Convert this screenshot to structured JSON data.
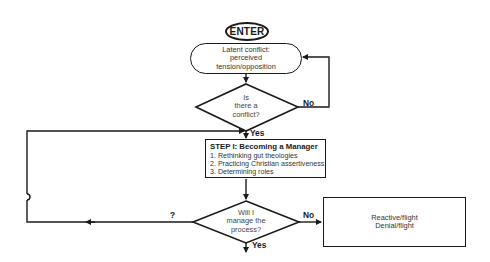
{
  "diagram": {
    "type": "flowchart",
    "start": {
      "label": "ENTER"
    },
    "latent_conflict": {
      "lines": [
        "Latent conflict:",
        "perceived",
        "tension/opposition"
      ]
    },
    "decision_conflict": {
      "lines": [
        "Is",
        "there a",
        "conflict?"
      ],
      "yes_label": "Yes",
      "no_label": "No"
    },
    "step1": {
      "title": "STEP I: Becoming a Manager",
      "items": [
        "1. Rethinking gut theologies",
        "2. Practicing Christian assertiveness",
        "3. Determining roles"
      ]
    },
    "decision_manage": {
      "lines": [
        "Will I",
        "manage the",
        "process?"
      ],
      "yes_label": "Yes",
      "no_label": "No",
      "loop_label": "?"
    },
    "reactive": {
      "lines": [
        "Reactive/flight",
        "Denial/flight"
      ]
    }
  }
}
